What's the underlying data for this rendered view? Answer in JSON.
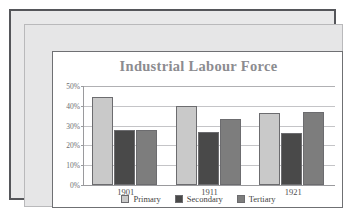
{
  "chart_data": {
    "type": "bar",
    "title": "Industrial Labour Force",
    "xlabel": "",
    "ylabel": "",
    "categories": [
      "1901",
      "1911",
      "1921"
    ],
    "series": [
      {
        "name": "Primary",
        "values": [
          44.5,
          40.0,
          36.5
        ],
        "color": "#c9c9c9"
      },
      {
        "name": "Secondary",
        "values": [
          28.0,
          27.0,
          26.5
        ],
        "color": "#494949"
      },
      {
        "name": "Tertiary",
        "values": [
          28.0,
          33.5,
          37.0
        ],
        "color": "#7d7d7d"
      }
    ],
    "ylim": [
      0,
      50
    ],
    "yticks": [
      "0%",
      "10%",
      "20%",
      "30%",
      "40%",
      "50%"
    ],
    "ytick_values": [
      0,
      10,
      20,
      30,
      40,
      50
    ],
    "grid": true,
    "legend_position": "bottom"
  },
  "style": {
    "title_color": "#8c8c90",
    "axis_color": "#9a9a9d",
    "grid_color": "#c4c4c7",
    "frame_color": "#55565a",
    "frame_fill": "#e6e6e7",
    "card_background": "#ffffff"
  }
}
